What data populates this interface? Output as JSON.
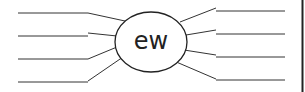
{
  "diagram": {
    "type": "word-web",
    "center": {
      "text": "ew",
      "cx": 151,
      "cy": 42,
      "rx": 36,
      "ry": 30
    },
    "stroke_color": "#333333",
    "border_color": "#222222",
    "left_branches": [
      {
        "line": [
          18,
          13,
          88,
          13
        ],
        "spoke": [
          88,
          13,
          125,
          21
        ]
      },
      {
        "line": [
          18,
          36,
          88,
          36
        ],
        "spoke": [
          88,
          33,
          117,
          36
        ]
      },
      {
        "line": [
          18,
          59,
          88,
          59
        ],
        "spoke": [
          88,
          59,
          117,
          47
        ]
      },
      {
        "line": [
          18,
          82,
          88,
          82
        ],
        "spoke": [
          88,
          81,
          123,
          57
        ]
      }
    ],
    "right_branches": [
      {
        "line": [
          216,
          11,
          285,
          11
        ],
        "spoke": [
          180,
          22,
          216,
          8
        ]
      },
      {
        "line": [
          216,
          34,
          285,
          34
        ],
        "spoke": [
          186,
          35,
          216,
          30
        ]
      },
      {
        "line": [
          216,
          57,
          285,
          57
        ],
        "spoke": [
          184,
          50,
          216,
          55
        ]
      },
      {
        "line": [
          216,
          80,
          285,
          80
        ],
        "spoke": [
          174,
          61,
          216,
          79
        ]
      }
    ]
  }
}
